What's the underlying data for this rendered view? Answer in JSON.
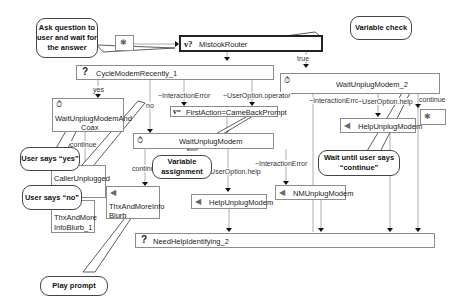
{
  "nodes": {
    "start": {
      "icon": "start-icon"
    },
    "mistook_router": {
      "icon_text": "ν?",
      "label": "MistookRouter"
    },
    "cycle_modem": {
      "icon_text": "?",
      "label": "CycleModemRecently_1"
    },
    "wait_unplug_modem_2": {
      "label": "WaitUnplugModem_2"
    },
    "wait_unplug_and_coax": {
      "label_line1": "WaitUnplugModemAnd",
      "label_line2": "Coax"
    },
    "first_action": {
      "icon_text": "ν=",
      "label": "FirstAction=CameBackPrompt"
    },
    "wait_unplug_modem": {
      "label": "WaitUnplugModem"
    },
    "help_unplug_modem_right": {
      "label": "HelpUnplugModem"
    },
    "pause_node": {
      "icon": "pause-icon"
    },
    "caller_unplugged": {
      "label_line1": "CallerUnplugged",
      "label_line2": "Coax"
    },
    "thx_more_info_blurb_1": {
      "label_line1": "ThxAndMore",
      "label_line2": "InfoBlurb_1"
    },
    "thx_more_info_blurb": {
      "label_line1": "ThxAndMoreInfo",
      "label_line2": "Blurb"
    },
    "help_unplug_modem_mid": {
      "label": "HelpUnplugModem"
    },
    "nm_unplug_modem": {
      "label": "NMUnplugModem"
    },
    "need_help_identifying": {
      "icon_text": "?",
      "label": "NeedHelpIdentifying_2"
    }
  },
  "edge_labels": {
    "true": "true",
    "yes": "yes",
    "no": "no",
    "interaction_error_1": "~InteractionError",
    "user_option_operator": "~UserOption.operator",
    "interaction_error_2": "~InteractionError",
    "user_option_help_1": "~UserOption.help",
    "continue_1": "continue",
    "continue_2": "continue",
    "continue_3": "continue",
    "interaction_error_3": "~InteractionError",
    "user_option_help_2": "~UserOption.help"
  },
  "callouts": {
    "ask_question": "Ask question to user and wait for the answer",
    "variable_check": "Variable check",
    "user_says_yes": "User says “yes”",
    "user_says_no": "User says “no”",
    "variable_assignment": "Variable assignment",
    "wait_continue": "Wait until user says “continue”",
    "play_prompt": "Play prompt"
  }
}
